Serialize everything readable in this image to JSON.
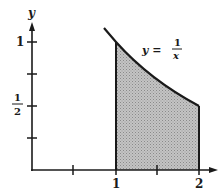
{
  "figure": {
    "axis_labels": {
      "y": "y"
    },
    "y_ticks": [
      {
        "value": 0.25,
        "label": ""
      },
      {
        "value": 0.5,
        "label_num": "1",
        "label_den": "2"
      },
      {
        "value": 0.75,
        "label": ""
      },
      {
        "value": 1,
        "label": "1"
      }
    ],
    "x_ticks": [
      {
        "value": 0.5,
        "label": ""
      },
      {
        "value": 1,
        "label": "1"
      },
      {
        "value": 1.5,
        "label": ""
      },
      {
        "value": 2,
        "label": "2"
      }
    ],
    "curve_label": {
      "lhs": "y =",
      "num": "1",
      "den": "x"
    },
    "shaded_region": {
      "from_x": 1,
      "to_x": 2,
      "function": "1/x"
    },
    "colors": {
      "ink": "#1a1a1a",
      "shade": "#b8b8b8"
    }
  }
}
